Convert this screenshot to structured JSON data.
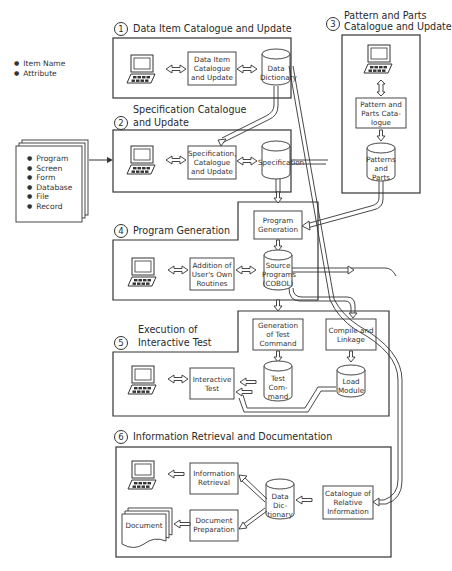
{
  "diagram": {
    "inputs": {
      "data_items": [
        "Item Name",
        "Attribute"
      ],
      "spec_items": [
        "Program",
        "Screen",
        "Form",
        "Database",
        "File",
        "Record"
      ]
    },
    "sections": [
      {
        "number": "1",
        "title": "Data Item Catalogue and Update",
        "process": [
          "Data Item",
          "Catalogue",
          "and Update"
        ],
        "store": [
          "Data",
          "Dictionary"
        ]
      },
      {
        "number": "2",
        "title": [
          "Specification Catalogue",
          "and Update"
        ],
        "process": [
          "Specification,",
          "Catalogue",
          "and Update"
        ],
        "store": [
          "Specification"
        ]
      },
      {
        "number": "3",
        "title": [
          "Pattern and Parts",
          "Catalogue and Update"
        ],
        "process": [
          "Pattern and",
          "Parts Cata-",
          "logue"
        ],
        "store": [
          "Patterns",
          "and",
          "Parts"
        ]
      },
      {
        "number": "4",
        "title": "Program Generation",
        "process": [
          "Program",
          "Generation"
        ],
        "process2": [
          "Addition of",
          "User's Own",
          "Routines"
        ],
        "store": [
          "Source",
          "Programs",
          "(COBOL)"
        ]
      },
      {
        "number": "5",
        "title": [
          "Execution of",
          "Interactive Test"
        ],
        "process": [
          "Generation",
          "of Test",
          "Command"
        ],
        "process2": [
          "Compile and",
          "Linkage"
        ],
        "process3": [
          "Interactive",
          "Test"
        ],
        "store": [
          "Test",
          "Com-",
          "mand"
        ],
        "store2": [
          "Load",
          "Module"
        ]
      },
      {
        "number": "6",
        "title": "Information Retrieval and Documentation",
        "process": [
          "Information",
          "Retrieval"
        ],
        "process2": [
          "Document",
          "Preparation"
        ],
        "process3": [
          "Catalogue of",
          "Relative",
          "Information"
        ],
        "store": [
          "Data",
          "Dic-",
          "tionary"
        ],
        "output": "Document"
      }
    ]
  }
}
